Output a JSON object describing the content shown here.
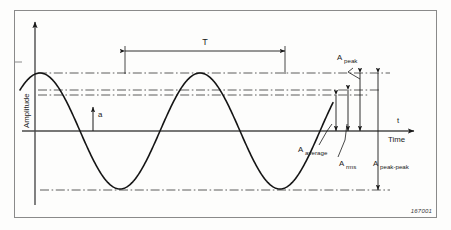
{
  "figure": {
    "id_code": "167001",
    "axis": {
      "y_label": "Amplitude",
      "x_label": "Time",
      "x_symbol": "t"
    },
    "annotations": {
      "period": "T",
      "instantaneous": "a",
      "peak_base": "A",
      "peak_sub": "peak",
      "average_base": "A",
      "average_sub": "average",
      "rms_base": "A",
      "rms_sub": "rms",
      "peak_peak_base": "A",
      "peak_peak_sub": "peak-peak"
    },
    "colors": {
      "ink": "#1a1a1a",
      "frame": "#6f6f6f",
      "background": "#fdfdfc",
      "dashdot": "#4a4a4a"
    }
  },
  "chart_data": {
    "type": "line",
    "title": "",
    "xlabel": "Time",
    "ylabel": "Amplitude",
    "legend": [],
    "grid": false,
    "series": [
      {
        "name": "sine waveform",
        "equation": "a = A_peak * sin(2*pi*t/T)",
        "amplitude_px": 58,
        "period_px": 160,
        "phase_offset_px": -45,
        "baseline_y_px": 131
      }
    ],
    "levels": [
      {
        "name": "A_peak",
        "y_px": 73,
        "style": "dash-dot"
      },
      {
        "name": "A_rms",
        "y_px": 90,
        "style": "dash-dot"
      },
      {
        "name": "A_average",
        "y_px": 95,
        "style": "dash-dot"
      },
      {
        "name": "zero",
        "y_px": 131,
        "style": "solid"
      },
      {
        "name": "A_negative_peak",
        "y_px": 190,
        "style": "dash-dot"
      }
    ],
    "dimensions": [
      {
        "name": "T",
        "from_x_px": 125,
        "to_x_px": 285,
        "y_px": 51
      },
      {
        "name": "A_peak",
        "x_px": 360,
        "from_y_px": 73,
        "to_y_px": 131
      },
      {
        "name": "A_rms",
        "x_px": 348,
        "from_y_px": 90,
        "to_y_px": 131
      },
      {
        "name": "A_average",
        "x_px": 336,
        "from_y_px": 95,
        "to_y_px": 131
      },
      {
        "name": "A_peak-peak",
        "x_px": 378,
        "from_y_px": 73,
        "to_y_px": 190
      },
      {
        "name": "a",
        "x_px": 93,
        "from_y_px": 110,
        "to_y_px": 131
      }
    ]
  }
}
